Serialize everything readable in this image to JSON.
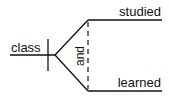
{
  "diagram": {
    "type": "sentence-diagram",
    "subject": "class",
    "conjunction": "and",
    "predicates": [
      "studied",
      "learned"
    ]
  }
}
